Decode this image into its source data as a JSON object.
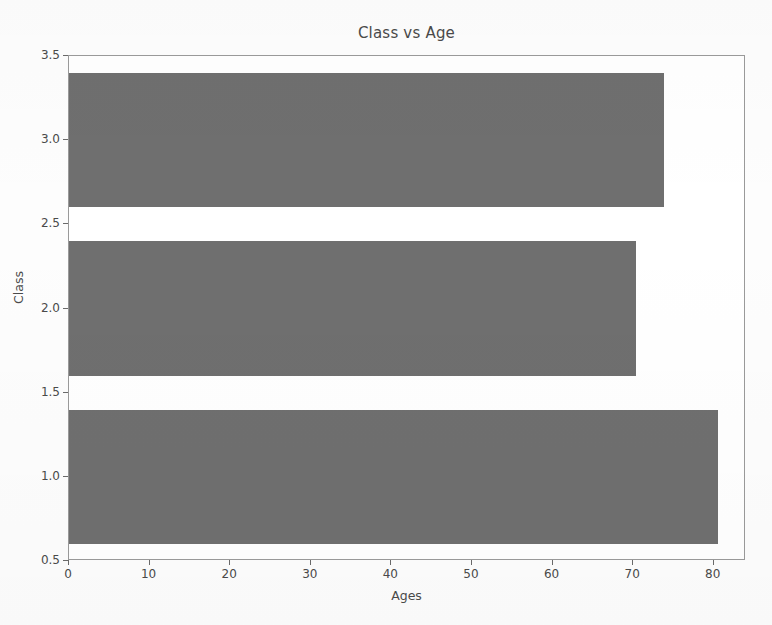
{
  "chart_data": {
    "type": "bar",
    "orientation": "horizontal",
    "title": "Class vs Age",
    "xlabel": "Ages",
    "ylabel": "Class",
    "categories": [
      "1",
      "2",
      "3"
    ],
    "values": [
      80.5,
      70.3,
      73.8
    ],
    "series": [
      {
        "name": "Ages",
        "values": [
          80.5,
          70.3,
          73.8
        ]
      }
    ],
    "xlim": [
      0,
      84
    ],
    "ylim": [
      0.5,
      3.5
    ],
    "x_ticks": [
      "0",
      "10",
      "20",
      "30",
      "40",
      "50",
      "60",
      "70",
      "80"
    ],
    "x_tick_values": [
      0,
      10,
      20,
      30,
      40,
      50,
      60,
      70,
      80
    ],
    "y_ticks": [
      "0.5",
      "1.0",
      "1.5",
      "2.0",
      "2.5",
      "3.0",
      "3.5"
    ],
    "y_tick_values": [
      0.5,
      1.0,
      1.5,
      2.0,
      2.5,
      3.0,
      3.5
    ],
    "grid": false,
    "legend": null,
    "bar_color": "#6f6f6f",
    "axis_color": "#9a9a9a",
    "text_color": "#4a4a4a",
    "background": "#ffffff"
  }
}
